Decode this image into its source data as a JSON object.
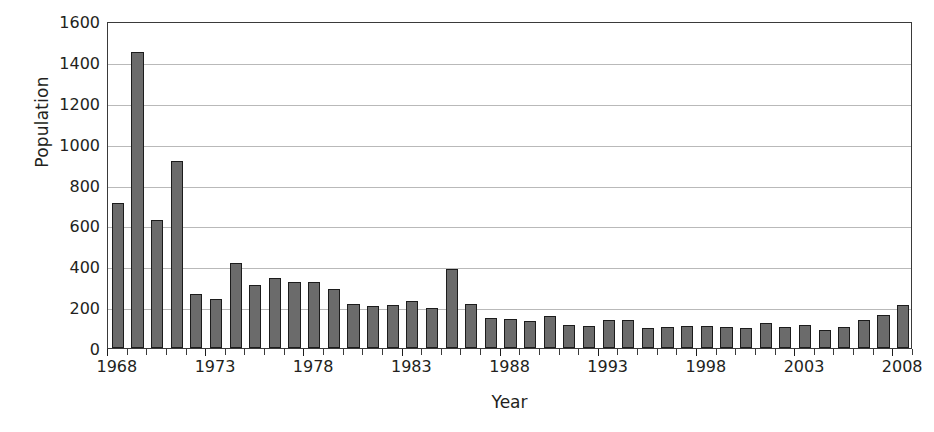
{
  "chart_data": {
    "type": "bar",
    "title": "",
    "xlabel": "Year",
    "ylabel": "Population",
    "ylim": [
      0,
      1600
    ],
    "ytick_values": [
      0,
      200,
      400,
      600,
      800,
      1000,
      1200,
      1400,
      1600
    ],
    "ytick_labels": [
      "0",
      "200",
      "400",
      "600",
      "800",
      "1000",
      "1200",
      "1400",
      "1600"
    ],
    "xtick_labels": [
      "1968",
      "1973",
      "1978",
      "1983",
      "1988",
      "1993",
      "1998",
      "2003",
      "2008"
    ],
    "grid": true,
    "legend": false,
    "bar_color": "#6b6b6b",
    "bar_edge_color": "#1c1c1c",
    "grid_color": "#b9b9b9",
    "axis_color": "#3a3a3a",
    "categories": [
      "1968",
      "1969",
      "1970",
      "1971",
      "1972",
      "1973",
      "1974",
      "1975",
      "1976",
      "1977",
      "1978",
      "1979",
      "1980",
      "1981",
      "1982",
      "1983",
      "1984",
      "1985",
      "1986",
      "1987",
      "1988",
      "1989",
      "1990",
      "1991",
      "1992",
      "1993",
      "1994",
      "1995",
      "1996",
      "1997",
      "1998",
      "1999",
      "2000",
      "2001",
      "2002",
      "2003",
      "2004",
      "2005",
      "2006",
      "2007",
      "2008"
    ],
    "values": [
      710,
      1450,
      625,
      915,
      262,
      242,
      415,
      310,
      345,
      325,
      325,
      290,
      215,
      205,
      210,
      230,
      195,
      385,
      215,
      145,
      140,
      130,
      155,
      115,
      110,
      135,
      135,
      100,
      105,
      110,
      110,
      105,
      100,
      120,
      105,
      115,
      90,
      105,
      135,
      160,
      210
    ]
  }
}
